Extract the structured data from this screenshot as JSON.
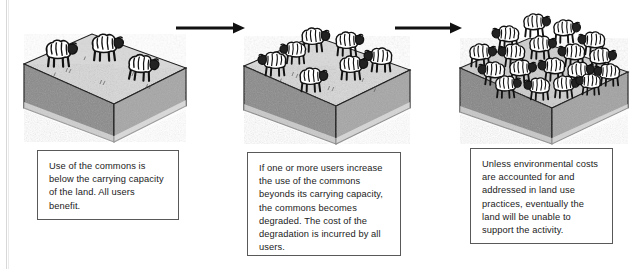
{
  "figure": {
    "stage_count": 3,
    "flow_icon": "right-arrow-icon"
  },
  "palette": {
    "ink": "#1b1b1b",
    "box_border": "#595959",
    "block_top": "#d9d9d9",
    "block_left": "#8a8a8a",
    "block_right": "#a6a6a6",
    "background": "#ffffff",
    "sheep_body": "#ffffff",
    "sheep_head": "#222222"
  },
  "panels": [
    {
      "id": "panel-1",
      "stage_label": "Stage 1",
      "sheep_count": 3,
      "caption": "Use of the commons is below the carrying capacity of the land. All users benefit."
    },
    {
      "id": "panel-2",
      "stage_label": "Stage 2",
      "sheep_count": 7,
      "caption": "If one or more users increase the use of the commons beyonds its carrying capacity, the commons becomes degraded. The cost of the degradation is incurred by all users."
    },
    {
      "id": "panel-3",
      "stage_label": "Stage 3",
      "sheep_count": 18,
      "caption": "Unless environmental costs are accounted for and addressed in land use practices, eventually the land will be unable to support the activity."
    }
  ],
  "arrows": [
    {
      "id": "arrow-1",
      "icon": "right-arrow-icon",
      "from": "panel-1",
      "to": "panel-2"
    },
    {
      "id": "arrow-2",
      "icon": "right-arrow-icon",
      "from": "panel-2",
      "to": "panel-3"
    }
  ]
}
